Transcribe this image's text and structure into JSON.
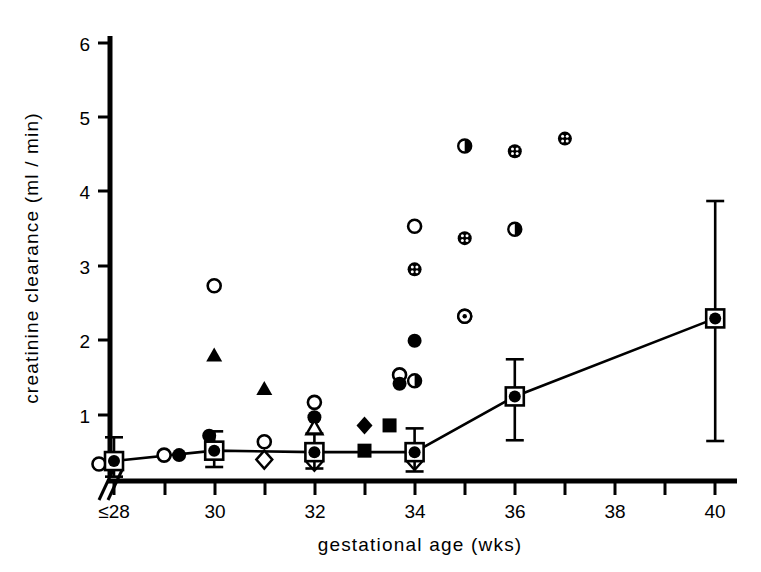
{
  "chart_data": {
    "type": "scatter",
    "title": "",
    "subtitle": "",
    "xlabel": "gestational age (wks)",
    "ylabel": "creatinine clearance (ml / min)",
    "xlim": [
      27.3,
      40.6
    ],
    "ylim": [
      0,
      6.3
    ],
    "x_ticks": [
      28,
      29,
      30,
      31,
      32,
      33,
      34,
      35,
      36,
      37,
      38,
      39,
      40
    ],
    "x_tick_labels": [
      "≤28",
      "",
      "30",
      "",
      "32",
      "",
      "34",
      "",
      "36",
      "",
      "38",
      "",
      "40"
    ],
    "y_ticks": [
      1,
      2,
      3,
      4,
      5,
      6
    ],
    "y_tick_labels": [
      "1",
      "2",
      "3",
      "4",
      "5",
      "6"
    ],
    "grid": false,
    "legend_position": "none",
    "axis_break": "y-axis broken below 0.2 (double slash mark at origin)",
    "annotations": [
      "Axis-break slashes drawn at lower-left corner of axes",
      "Mean values connected by a solid line with vertical error bars"
    ],
    "series": [
      {
        "name": "mean with error bars",
        "marker": "square-with-filled-circle",
        "line": true,
        "points": [
          {
            "x": 28,
            "y": 0.38,
            "err_low": 0.17,
            "err_high": 0.7
          },
          {
            "x": 30,
            "y": 0.52,
            "err_low": 0.3,
            "err_high": 0.78
          },
          {
            "x": 32,
            "y": 0.5,
            "err_low": 0.28,
            "err_high": 0.75
          },
          {
            "x": 34,
            "y": 0.5,
            "err_low": 0.24,
            "err_high": 0.82
          },
          {
            "x": 36,
            "y": 1.25,
            "err_low": 0.66,
            "err_high": 1.75
          },
          {
            "x": 40,
            "y": 2.3,
            "err_low": 0.65,
            "err_high": 3.88
          }
        ]
      },
      {
        "name": "open circle",
        "marker": "open-circle",
        "line": false,
        "points": [
          {
            "x": 27.7,
            "y": 0.34
          },
          {
            "x": 29.0,
            "y": 0.46
          },
          {
            "x": 30.0,
            "y": 2.74
          },
          {
            "x": 31.0,
            "y": 0.64
          },
          {
            "x": 32.0,
            "y": 1.17
          },
          {
            "x": 33.7,
            "y": 1.54
          },
          {
            "x": 34.0,
            "y": 3.54
          },
          {
            "x": 35.0,
            "y": 2.33
          }
        ]
      },
      {
        "name": "filled circle",
        "marker": "filled-circle",
        "line": false,
        "points": [
          {
            "x": 29.3,
            "y": 0.46
          },
          {
            "x": 29.9,
            "y": 0.72
          },
          {
            "x": 32.0,
            "y": 0.97
          },
          {
            "x": 33.7,
            "y": 1.42
          },
          {
            "x": 34.0,
            "y": 2.0
          }
        ]
      },
      {
        "name": "half-filled circle",
        "marker": "half-filled-circle",
        "line": false,
        "points": [
          {
            "x": 34.0,
            "y": 1.46
          },
          {
            "x": 35.0,
            "y": 4.62
          },
          {
            "x": 36.0,
            "y": 3.5
          }
        ]
      },
      {
        "name": "dotted-filled circle",
        "marker": "dotted-filled-circle",
        "line": false,
        "points": [
          {
            "x": 34.0,
            "y": 2.96
          },
          {
            "x": 35.0,
            "y": 3.38
          },
          {
            "x": 36.0,
            "y": 4.55
          },
          {
            "x": 37.0,
            "y": 4.72
          }
        ]
      },
      {
        "name": "open circle with dot",
        "marker": "circle-with-dot",
        "line": false,
        "points": [
          {
            "x": 35.0,
            "y": 2.33
          }
        ]
      },
      {
        "name": "filled triangle",
        "marker": "filled-triangle",
        "line": false,
        "points": [
          {
            "x": 30.0,
            "y": 1.8
          },
          {
            "x": 31.0,
            "y": 1.35
          }
        ]
      },
      {
        "name": "open triangle",
        "marker": "open-triangle",
        "line": false,
        "points": [
          {
            "x": 32.0,
            "y": 0.82
          }
        ]
      },
      {
        "name": "filled diamond",
        "marker": "filled-diamond",
        "line": false,
        "points": [
          {
            "x": 33.0,
            "y": 0.86
          }
        ]
      },
      {
        "name": "open diamond",
        "marker": "open-diamond",
        "line": false,
        "points": [
          {
            "x": 31.0,
            "y": 0.4
          },
          {
            "x": 32.0,
            "y": 0.37
          },
          {
            "x": 34.0,
            "y": 0.38
          }
        ]
      },
      {
        "name": "filled square",
        "marker": "filled-square",
        "line": false,
        "points": [
          {
            "x": 33.0,
            "y": 0.52
          },
          {
            "x": 33.5,
            "y": 0.86
          }
        ]
      }
    ]
  },
  "axes": {
    "x_title": "gestational age (wks)",
    "y_title": "creatinine clearance (ml / min)",
    "y_tick_6": "6",
    "y_tick_5": "5",
    "y_tick_4": "4",
    "y_tick_3": "3",
    "y_tick_2": "2",
    "y_tick_1": "1",
    "x_tick_28": "≤28",
    "x_tick_30": "30",
    "x_tick_32": "32",
    "x_tick_34": "34",
    "x_tick_36": "36",
    "x_tick_38": "38",
    "x_tick_40": "40"
  },
  "style": {
    "ink": "#000000",
    "paper": "#ffffff"
  }
}
